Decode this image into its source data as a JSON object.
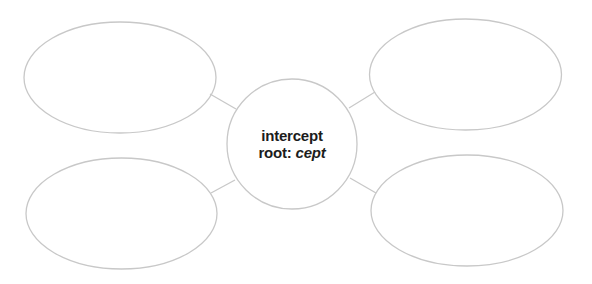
{
  "diagram": {
    "type": "word-web",
    "stroke_color": "#c8c8c8",
    "background": "#ffffff",
    "text_color": "#1c1c1c",
    "center": {
      "word": "intercept",
      "root_label": "root:",
      "root_value": "cept"
    },
    "branches": [
      {
        "position": "top-left",
        "text": ""
      },
      {
        "position": "top-right",
        "text": ""
      },
      {
        "position": "bottom-left",
        "text": ""
      },
      {
        "position": "bottom-right",
        "text": ""
      }
    ]
  }
}
